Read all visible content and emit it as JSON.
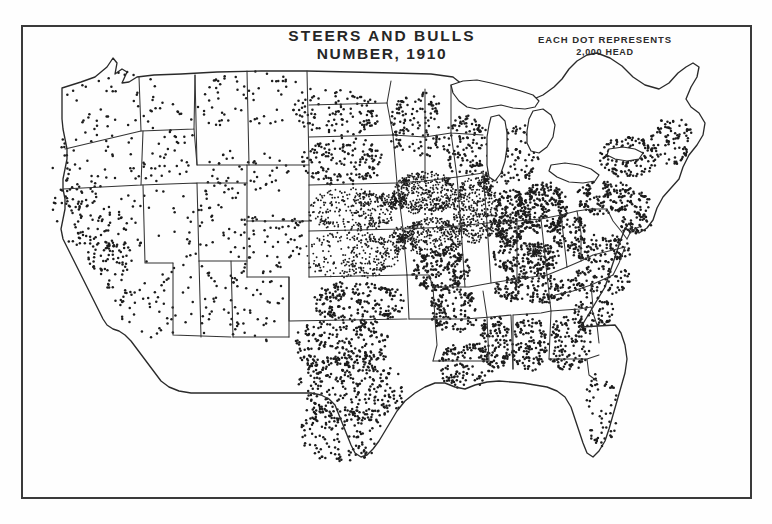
{
  "figure": {
    "title_line1": "STEERS AND BULLS",
    "title_line2": "NUMBER, 1910",
    "legend_line1": "EACH DOT REPRESENTS",
    "legend_line2": "2,000 HEAD",
    "frame_color": "#3a3a3a",
    "dot_color": "#1c1c1c",
    "outline_color": "#333333",
    "paper_color": "#fefefe"
  },
  "chart_data": {
    "type": "scatter",
    "title": "STEERS AND BULLS NUMBER, 1910",
    "subtitle": "EACH DOT REPRESENTS 2,000 HEAD",
    "xlabel": "",
    "ylabel": "",
    "map_region": "Contiguous United States",
    "dot_unit_head": 2000,
    "legend_position": "top-right",
    "grid": false,
    "density_regions": [
      {
        "name": "Washington",
        "cx": 95,
        "cy": 75,
        "rx": 52,
        "ry": 33,
        "dots": 40,
        "scatter": "uniform"
      },
      {
        "name": "Oregon",
        "cx": 78,
        "cy": 133,
        "rx": 50,
        "ry": 33,
        "dots": 46,
        "scatter": "uniform"
      },
      {
        "name": "Idaho",
        "cx": 148,
        "cy": 118,
        "rx": 27,
        "ry": 48,
        "dots": 42,
        "scatter": "uniform"
      },
      {
        "name": "Montana",
        "cx": 232,
        "cy": 76,
        "rx": 64,
        "ry": 32,
        "dots": 70,
        "scatter": "uniform"
      },
      {
        "name": "Wyoming",
        "cx": 228,
        "cy": 148,
        "rx": 45,
        "ry": 29,
        "dots": 52,
        "scatter": "uniform"
      },
      {
        "name": "Nevada",
        "cx": 118,
        "cy": 196,
        "rx": 32,
        "ry": 48,
        "dots": 26,
        "scatter": "uniform"
      },
      {
        "name": "Utah",
        "cx": 180,
        "cy": 195,
        "rx": 30,
        "ry": 38,
        "dots": 34,
        "scatter": "uniform"
      },
      {
        "name": "Colorado",
        "cx": 248,
        "cy": 213,
        "rx": 44,
        "ry": 31,
        "dots": 66,
        "scatter": "uniform"
      },
      {
        "name": "Arizona",
        "cx": 168,
        "cy": 272,
        "rx": 33,
        "ry": 43,
        "dots": 40,
        "scatter": "uniform"
      },
      {
        "name": "New Mexico",
        "cx": 233,
        "cy": 278,
        "rx": 34,
        "ry": 42,
        "dots": 52,
        "scatter": "uniform"
      },
      {
        "name": "California North",
        "cx": 57,
        "cy": 185,
        "rx": 26,
        "ry": 36,
        "dots": 70,
        "scatter": "clustered"
      },
      {
        "name": "California Central Valley",
        "cx": 88,
        "cy": 225,
        "rx": 22,
        "ry": 40,
        "dots": 95,
        "scatter": "clustered"
      },
      {
        "name": "California South",
        "cx": 120,
        "cy": 288,
        "rx": 28,
        "ry": 32,
        "dots": 34,
        "scatter": "uniform"
      },
      {
        "name": "North Dakota",
        "cx": 318,
        "cy": 88,
        "rx": 42,
        "ry": 25,
        "dots": 105,
        "scatter": "uniform"
      },
      {
        "name": "South Dakota",
        "cx": 322,
        "cy": 136,
        "rx": 44,
        "ry": 25,
        "dots": 150,
        "scatter": "uniform"
      },
      {
        "name": "Nebraska",
        "cx": 330,
        "cy": 184,
        "rx": 48,
        "ry": 23,
        "dots": 330,
        "scatter": "gradient-east"
      },
      {
        "name": "Kansas",
        "cx": 330,
        "cy": 230,
        "rx": 50,
        "ry": 24,
        "dots": 300,
        "scatter": "gradient-east"
      },
      {
        "name": "Oklahoma",
        "cx": 337,
        "cy": 277,
        "rx": 48,
        "ry": 22,
        "dots": 210,
        "scatter": "uniform"
      },
      {
        "name": "Texas North",
        "cx": 320,
        "cy": 320,
        "rx": 50,
        "ry": 28,
        "dots": 230,
        "scatter": "uniform"
      },
      {
        "name": "Texas Central",
        "cx": 330,
        "cy": 365,
        "rx": 56,
        "ry": 34,
        "dots": 260,
        "scatter": "uniform"
      },
      {
        "name": "Texas South",
        "cx": 320,
        "cy": 410,
        "rx": 42,
        "ry": 28,
        "dots": 130,
        "scatter": "uniform"
      },
      {
        "name": "Minnesota",
        "cx": 396,
        "cy": 100,
        "rx": 30,
        "ry": 35,
        "dots": 125,
        "scatter": "uniform"
      },
      {
        "name": "Wisconsin",
        "cx": 443,
        "cy": 120,
        "rx": 25,
        "ry": 31,
        "dots": 120,
        "scatter": "uniform"
      },
      {
        "name": "Michigan",
        "cx": 495,
        "cy": 130,
        "rx": 24,
        "ry": 33,
        "dots": 95,
        "scatter": "uniform"
      },
      {
        "name": "Iowa",
        "cx": 404,
        "cy": 168,
        "rx": 33,
        "ry": 22,
        "dots": 430,
        "scatter": "dense"
      },
      {
        "name": "Illinois",
        "cx": 455,
        "cy": 185,
        "rx": 23,
        "ry": 34,
        "dots": 400,
        "scatter": "dense"
      },
      {
        "name": "Missouri North",
        "cx": 412,
        "cy": 212,
        "rx": 30,
        "ry": 20,
        "dots": 330,
        "scatter": "dense"
      },
      {
        "name": "Missouri South",
        "cx": 420,
        "cy": 245,
        "rx": 30,
        "ry": 22,
        "dots": 200,
        "scatter": "uniform"
      },
      {
        "name": "Kansas City Cluster",
        "cx": 381,
        "cy": 214,
        "rx": 13,
        "ry": 13,
        "dots": 150,
        "scatter": "hotspot"
      },
      {
        "name": "Chicago Cluster",
        "cx": 466,
        "cy": 155,
        "rx": 11,
        "ry": 10,
        "dots": 95,
        "scatter": "hotspot"
      },
      {
        "name": "Omaha Cluster",
        "cx": 375,
        "cy": 176,
        "rx": 11,
        "ry": 10,
        "dots": 90,
        "scatter": "hotspot"
      },
      {
        "name": "Indiana",
        "cx": 489,
        "cy": 192,
        "rx": 18,
        "ry": 30,
        "dots": 230,
        "scatter": "uniform"
      },
      {
        "name": "Ohio",
        "cx": 524,
        "cy": 183,
        "rx": 23,
        "ry": 27,
        "dots": 225,
        "scatter": "uniform"
      },
      {
        "name": "Kentucky",
        "cx": 505,
        "cy": 233,
        "rx": 35,
        "ry": 17,
        "dots": 185,
        "scatter": "uniform"
      },
      {
        "name": "Bluegrass Cluster",
        "cx": 514,
        "cy": 227,
        "rx": 9,
        "ry": 8,
        "dots": 70,
        "scatter": "hotspot"
      },
      {
        "name": "Tennessee",
        "cx": 512,
        "cy": 263,
        "rx": 42,
        "ry": 16,
        "dots": 170,
        "scatter": "uniform"
      },
      {
        "name": "Arkansas",
        "cx": 433,
        "cy": 285,
        "rx": 26,
        "ry": 23,
        "dots": 130,
        "scatter": "uniform"
      },
      {
        "name": "Louisiana",
        "cx": 443,
        "cy": 340,
        "rx": 26,
        "ry": 25,
        "dots": 120,
        "scatter": "uniform"
      },
      {
        "name": "Mississippi",
        "cx": 474,
        "cy": 318,
        "rx": 17,
        "ry": 30,
        "dots": 125,
        "scatter": "uniform"
      },
      {
        "name": "Alabama",
        "cx": 508,
        "cy": 318,
        "rx": 18,
        "ry": 30,
        "dots": 125,
        "scatter": "uniform"
      },
      {
        "name": "Georgia",
        "cx": 548,
        "cy": 318,
        "rx": 24,
        "ry": 28,
        "dots": 130,
        "scatter": "uniform"
      },
      {
        "name": "Florida",
        "cx": 580,
        "cy": 385,
        "rx": 17,
        "ry": 38,
        "dots": 55,
        "scatter": "uniform"
      },
      {
        "name": "South Carolina",
        "cx": 573,
        "cy": 287,
        "rx": 21,
        "ry": 16,
        "dots": 60,
        "scatter": "uniform"
      },
      {
        "name": "North Carolina",
        "cx": 580,
        "cy": 255,
        "rx": 34,
        "ry": 15,
        "dots": 85,
        "scatter": "uniform"
      },
      {
        "name": "Virginia",
        "cx": 578,
        "cy": 224,
        "rx": 33,
        "ry": 15,
        "dots": 110,
        "scatter": "uniform"
      },
      {
        "name": "West Virginia",
        "cx": 548,
        "cy": 207,
        "rx": 18,
        "ry": 18,
        "dots": 75,
        "scatter": "uniform"
      },
      {
        "name": "Pennsylvania",
        "cx": 585,
        "cy": 173,
        "rx": 30,
        "ry": 18,
        "dots": 150,
        "scatter": "uniform"
      },
      {
        "name": "New York",
        "cx": 607,
        "cy": 132,
        "rx": 30,
        "ry": 21,
        "dots": 140,
        "scatter": "uniform"
      },
      {
        "name": "New England",
        "cx": 651,
        "cy": 116,
        "rx": 22,
        "ry": 24,
        "dots": 85,
        "scatter": "uniform"
      },
      {
        "name": "Maryland Delaware",
        "cx": 614,
        "cy": 199,
        "rx": 17,
        "ry": 10,
        "dots": 40,
        "scatter": "uniform"
      },
      {
        "name": "New Jersey",
        "cx": 621,
        "cy": 180,
        "rx": 9,
        "ry": 13,
        "dots": 30,
        "scatter": "uniform"
      }
    ]
  }
}
